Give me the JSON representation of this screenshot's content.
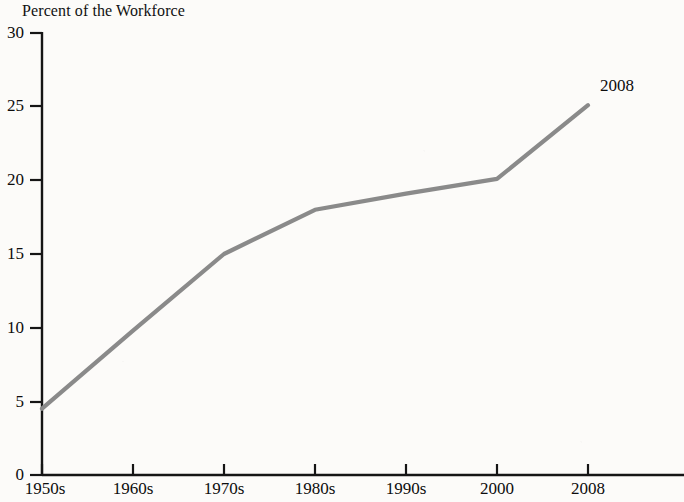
{
  "chart_data": {
    "type": "line",
    "title": "Percent of the Workforce",
    "xlabel": "",
    "ylabel": "",
    "grid": false,
    "legend": null,
    "categories": [
      "1950s",
      "1960s",
      "1970s",
      "1980s",
      "1990s",
      "2000",
      "2008"
    ],
    "values": [
      4.5,
      9.8,
      15.0,
      18.0,
      19.1,
      20.1,
      25.1
    ],
    "series": [
      {
        "name": "Percent of the Workforce",
        "values": [
          4.5,
          9.8,
          15.0,
          18.0,
          19.1,
          20.1,
          25.1
        ]
      }
    ],
    "annotations": [
      {
        "text": "2008",
        "x": "2008",
        "y": 25.1
      }
    ],
    "xlim": [
      0,
      6
    ],
    "ylim": [
      0,
      30
    ],
    "y_ticks": [
      "0",
      "5",
      "10",
      "15",
      "20",
      "25",
      "30"
    ],
    "y_tick_values": [
      0,
      5,
      10,
      15,
      20,
      25,
      30
    ],
    "x_ticks": [
      "1950s",
      "1960s",
      "1970s",
      "1980s",
      "1990s",
      "2000",
      "2008"
    ],
    "line_color": "#8a8a8a",
    "axis_color": "#151515"
  }
}
